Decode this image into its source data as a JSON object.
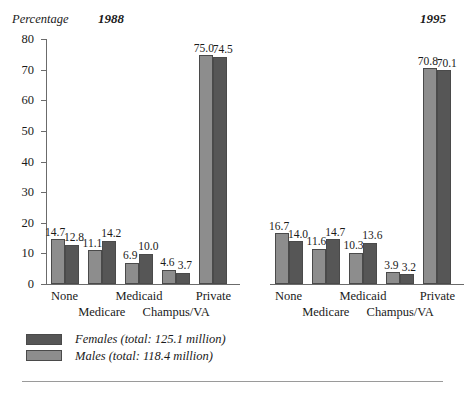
{
  "axis_title": "Percentage",
  "colors": {
    "female": "#565656",
    "male": "#8d8d8d",
    "axis": "#6b6b6b",
    "rule": "#9a9a9a"
  },
  "panels": [
    {
      "title": "1988",
      "show_yaxis": true,
      "legend": [
        {
          "series": "female",
          "text": "Females (total:  125.1 million)"
        },
        {
          "series": "male",
          "text": "Males (total:  118.4 million)"
        }
      ]
    },
    {
      "title": "1995",
      "show_yaxis": false,
      "legend": [
        {
          "series": "female",
          "text": "Females (total:  134.9 million)"
        },
        {
          "series": "male",
          "text": "Males (total:  128.9 million)"
        }
      ]
    }
  ],
  "chart_data": [
    {
      "type": "bar",
      "title": "1988",
      "xlabel": "",
      "ylabel": "Percentage",
      "ylim": [
        0,
        80
      ],
      "yticks": [
        0,
        10,
        20,
        30,
        40,
        50,
        60,
        70,
        80
      ],
      "ytick_labels": [
        "0",
        "10",
        "20",
        "30",
        "40",
        "50",
        "60",
        "70",
        "80"
      ],
      "grid": false,
      "legend_position": "below",
      "categories": [
        "None",
        "Medicare",
        "Medicaid",
        "Champus/VA",
        "Private"
      ],
      "series": [
        {
          "name": "Males",
          "values": [
            14.7,
            11.1,
            6.9,
            4.6,
            75.0
          ]
        },
        {
          "name": "Females",
          "values": [
            12.8,
            14.2,
            10.0,
            3.7,
            74.5
          ]
        }
      ],
      "series_order": [
        "Males",
        "Females"
      ],
      "totals": {
        "Females": "125.1 million",
        "Males": "118.4 million"
      }
    },
    {
      "type": "bar",
      "title": "1995",
      "xlabel": "",
      "ylabel": "Percentage",
      "ylim": [
        0,
        80
      ],
      "yticks": [
        0,
        10,
        20,
        30,
        40,
        50,
        60,
        70,
        80
      ],
      "ytick_labels": [],
      "grid": false,
      "legend_position": "below",
      "categories": [
        "None",
        "Medicare",
        "Medicaid",
        "Champus/VA",
        "Private"
      ],
      "series": [
        {
          "name": "Males",
          "values": [
            16.7,
            11.6,
            10.3,
            3.9,
            70.8
          ]
        },
        {
          "name": "Females",
          "values": [
            14.0,
            14.7,
            13.6,
            3.2,
            70.1
          ]
        }
      ],
      "series_order": [
        "Males",
        "Females"
      ],
      "totals": {
        "Females": "134.9 million",
        "Males": "128.9 million"
      }
    }
  ]
}
